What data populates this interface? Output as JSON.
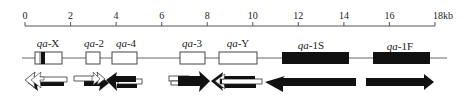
{
  "figure": {
    "type": "gene-cluster-map",
    "ruler": {
      "unit": "kb",
      "ticks": [
        "0",
        "2",
        "4",
        "6",
        "8",
        "10",
        "12",
        "14",
        "16",
        "18kb"
      ],
      "min": 0,
      "max": 18
    },
    "genes": [
      {
        "id": "qa-X",
        "prefix": "qa",
        "suffix": "-X",
        "fill": "white",
        "start_kb": 0.45,
        "end_kb": 1.6,
        "band": true
      },
      {
        "id": "qa-2",
        "prefix": "qa",
        "suffix": "-2",
        "fill": "white",
        "start_kb": 2.7,
        "end_kb": 3.3
      },
      {
        "id": "qa-4",
        "prefix": "qa",
        "suffix": "-4",
        "fill": "white",
        "start_kb": 3.8,
        "end_kb": 4.9
      },
      {
        "id": "qa-3",
        "prefix": "qa",
        "suffix": "-3",
        "fill": "white",
        "start_kb": 6.8,
        "end_kb": 7.9
      },
      {
        "id": "qa-Y",
        "prefix": "qa",
        "suffix": "-Y",
        "fill": "white",
        "start_kb": 8.5,
        "end_kb": 10.2
      },
      {
        "id": "qa-1S",
        "prefix": "qa",
        "suffix": "-1S",
        "fill": "black",
        "start_kb": 11.3,
        "end_kb": 14.2
      },
      {
        "id": "qa-1F",
        "prefix": "qa",
        "suffix": "-1F",
        "fill": "black",
        "start_kb": 15.3,
        "end_kb": 17.8
      }
    ],
    "transcripts": [
      {
        "gene": "qa-X",
        "direction": "left",
        "style": "white-over-black"
      },
      {
        "gene": "qa-2",
        "direction": "right",
        "style": "white-over-black"
      },
      {
        "gene": "qa-4",
        "direction": "left",
        "style": "black-over-white"
      },
      {
        "gene": "qa-3",
        "direction": "right",
        "style": "white-over-black"
      },
      {
        "gene": "qa-Y",
        "direction": "left",
        "style": "black-over-white"
      },
      {
        "gene": "qa-1S",
        "direction": "left",
        "style": "black"
      },
      {
        "gene": "qa-1F",
        "direction": "right",
        "style": "black"
      }
    ],
    "colors": {
      "line": "#555555",
      "dark": "#111111",
      "box_stroke": "#444444"
    }
  }
}
